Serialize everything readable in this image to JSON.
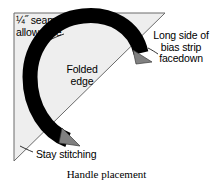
{
  "figure": {
    "caption": "Handle placement",
    "title": "Handle placement"
  },
  "labels": {
    "seam_allowance": "¼˝ seam\nallowance",
    "long_side": "Long side of\nbias strip\nfacedown",
    "folded_edge": "Folded\nedge",
    "stay_stitching": "Stay stitching"
  },
  "colors": {
    "fabric_fill": "#eeeeee",
    "fabric_edge": "#6b6b6b",
    "band": "#000000",
    "arrowhead": "#808080",
    "stitching_line": "#555555",
    "text": "#000000",
    "background": "#ffffff"
  },
  "shapes": {
    "triangle_name": "fabric-triangle",
    "triangle_points": "14,13 165,13 14,161",
    "band_name": "folded-bias-strip-band",
    "stay_stitch_style": "dashed"
  }
}
